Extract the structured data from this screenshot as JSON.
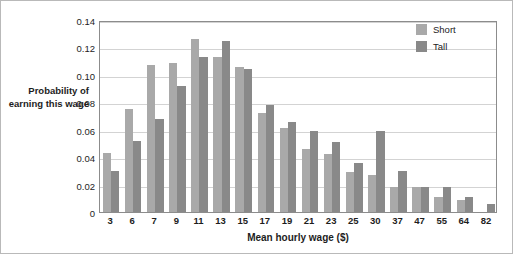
{
  "chart_data": {
    "type": "bar",
    "title": "",
    "subtitle": "",
    "xlabel": "Mean hourly wage ($)",
    "ylabel": "Probability of earning this wage",
    "ylim": [
      0,
      0.14
    ],
    "yticks": [
      "0",
      "0.02",
      "0.04",
      "0.06",
      "0.08",
      "0.10",
      "0.12",
      "0.14"
    ],
    "ytick_values": [
      0,
      0.02,
      0.04,
      0.06,
      0.08,
      0.1,
      0.12,
      0.14
    ],
    "grid": "horizontal",
    "legend_position": "top-right",
    "categories": [
      "3",
      "6",
      "7",
      "9",
      "11",
      "13",
      "15",
      "17",
      "19",
      "21",
      "23",
      "25",
      "30",
      "37",
      "47",
      "55",
      "64",
      "82"
    ],
    "series": [
      {
        "name": "Short",
        "color": "#a9a9a9",
        "values": [
          0.043,
          0.075,
          0.107,
          0.109,
          0.126,
          0.113,
          0.106,
          0.072,
          0.061,
          0.046,
          0.042,
          0.029,
          0.027,
          0.018,
          0.018,
          0.011,
          0.009,
          0.0
        ]
      },
      {
        "name": "Tall",
        "color": "#898989",
        "values": [
          0.03,
          0.052,
          0.068,
          0.092,
          0.113,
          0.125,
          0.104,
          0.078,
          0.066,
          0.059,
          0.051,
          0.036,
          0.059,
          0.03,
          0.018,
          0.018,
          0.011,
          0.006
        ]
      }
    ]
  },
  "legend": {
    "items": [
      {
        "label": "Short",
        "color": "#a9a9a9"
      },
      {
        "label": "Tall",
        "color": "#898989"
      }
    ]
  }
}
